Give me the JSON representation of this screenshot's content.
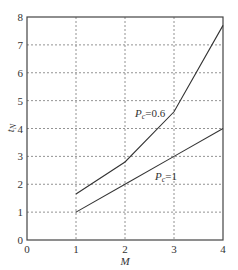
{
  "chart_data": {
    "type": "line",
    "title": "",
    "xlabel": "M",
    "ylabel": "t_N",
    "xlim": [
      0,
      4
    ],
    "ylim": [
      0,
      8
    ],
    "xticks": [
      "0",
      "1",
      "2",
      "3",
      "4"
    ],
    "yticks": [
      "0",
      "1",
      "2",
      "3",
      "4",
      "5",
      "6",
      "7",
      "8"
    ],
    "grid": true,
    "series": [
      {
        "name": "Pc=0.6",
        "label_main": "P",
        "label_sub": "c",
        "label_rest": "=0.6",
        "x": [
          1,
          2,
          3,
          4
        ],
        "values": [
          1.65,
          2.8,
          4.6,
          7.7
        ]
      },
      {
        "name": "Pc=1",
        "label_main": "P",
        "label_sub": "c",
        "label_rest": "=1",
        "x": [
          1,
          2,
          3,
          4
        ],
        "values": [
          1,
          2,
          3,
          4
        ]
      }
    ]
  }
}
